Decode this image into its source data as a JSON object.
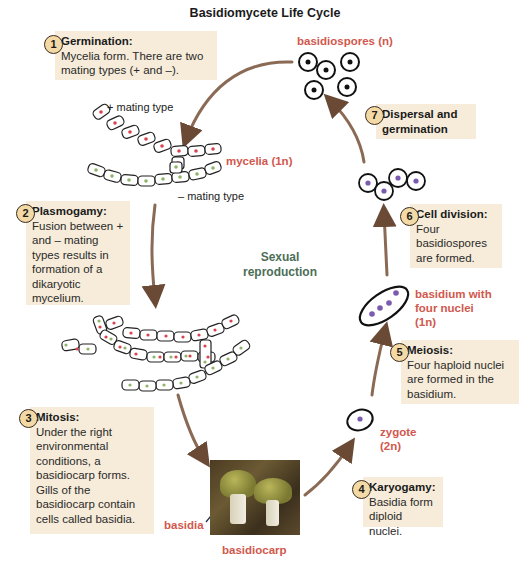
{
  "title": "Basidiomycete Life Cycle",
  "steps": [
    {
      "number": "1",
      "heading": "Germination:",
      "text": "Mycelia form. There are two mating types (+ and –)."
    },
    {
      "number": "2",
      "heading": "Plasmogamy:",
      "text": "Fusion between + and – mating types results in formation of a dikaryotic mycelium."
    },
    {
      "number": "3",
      "heading": "Mitosis:",
      "text": "Under the right environmental conditions, a basidiocarp forms. Gills of the basidiocarp contain cells called basidia."
    },
    {
      "number": "4",
      "heading": "Karyogamy:",
      "text": "Basidia form diploid nuclei."
    },
    {
      "number": "5",
      "heading": "Meiosis:",
      "text": "Four haploid nuclei are formed in the basidium."
    },
    {
      "number": "6",
      "heading": "Cell division:",
      "text": "Four basidiospores are formed."
    },
    {
      "number": "7",
      "heading": "Dispersal and germination",
      "text": ""
    }
  ],
  "labels": {
    "basidiospores": "basidiospores (n)",
    "mycelia": "mycelia (1n)",
    "plus_mating": "+ mating type",
    "minus_mating": "– mating type",
    "sexual_reproduction_1": "Sexual",
    "sexual_reproduction_2": "reproduction",
    "basidium_1": "basidium with",
    "basidium_2": "four nuclei",
    "basidium_3": "(1n)",
    "zygote_1": "zygote",
    "zygote_2": "(2n)",
    "basidia": "basidia",
    "basidiocarp": "basidiocarp"
  },
  "colors": {
    "box_bg": "#f6ecd9",
    "badge_bg": "#f3d9a6",
    "label_red": "#d1584d",
    "label_green": "#4c6e57",
    "arrow": "#7a5a45",
    "plus_nucleus": "#d9434e",
    "minus_nucleus": "#8fb56a",
    "spore_nucleus": "#7b5bb0"
  }
}
